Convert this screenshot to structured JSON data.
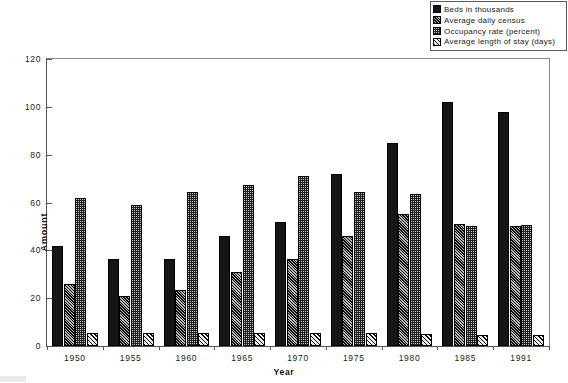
{
  "chart_data": {
    "type": "bar",
    "title": "",
    "xlabel": "Year",
    "ylabel": "Amount",
    "ylim": [
      0,
      120
    ],
    "ytick_values": [
      0,
      20,
      40,
      60,
      80,
      100,
      120
    ],
    "ytick_labels": [
      "0",
      "20",
      "40",
      "60",
      "80",
      "100",
      "120"
    ],
    "grid": false,
    "legend_position": "top-right",
    "categories": [
      "1950",
      "1955",
      "1960",
      "1965",
      "1970",
      "1975",
      "1980",
      "1985",
      "1991"
    ],
    "series": [
      {
        "name": "Beds in thousands",
        "pattern": "solid-black",
        "color": "#151515",
        "values": [
          42,
          36.5,
          36.5,
          46,
          52,
          72,
          85,
          102,
          98
        ]
      },
      {
        "name": "Average daily census",
        "pattern": "dense-diagonal-hatch",
        "color": "#3d3d3d",
        "values": [
          26,
          21,
          23.5,
          31,
          36.5,
          46,
          55,
          51,
          50
        ]
      },
      {
        "name": "Occupancy rate (percent)",
        "pattern": "checkerboard",
        "color": "#c9c9c9",
        "values": [
          62,
          59,
          64.5,
          67.5,
          71,
          64.5,
          63.5,
          50,
          50.5
        ]
      },
      {
        "name": "Average length of stay (days)",
        "pattern": "diagonal-stripe",
        "color": "#d8d8d8",
        "values": [
          5.5,
          5.5,
          5.5,
          5.5,
          5.5,
          5.5,
          5,
          4.5,
          4.5
        ]
      }
    ]
  },
  "legend": {
    "items": [
      "Beds in thousands",
      "Average daily census",
      "Occupancy rate (percent)",
      "Average length of stay (days)"
    ]
  },
  "axes": {
    "y_title": "Amount",
    "x_title": "Year"
  }
}
